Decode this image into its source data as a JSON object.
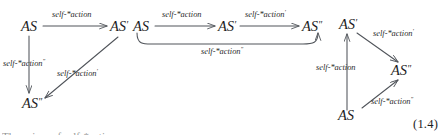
{
  "figure": {
    "equation_number": "(1.4)",
    "partial_caption_line": "The axiom of self-*action",
    "colors": {
      "arrow": "#50545a",
      "text": "#1d1d1d",
      "background": "#ffffff"
    },
    "labels": {
      "as": "AS",
      "as_prime": "AS′",
      "as_double_prime": "AS″",
      "action": "self-*action",
      "action_prime": "self-*action′",
      "action_double_prime": "self-*action″"
    },
    "diagrams": [
      {
        "id": "diagram-left",
        "nodes": [
          {
            "id": "left-as",
            "text": "AS",
            "x": 30,
            "y": 26
          },
          {
            "id": "left-as-prime",
            "text": "AS′",
            "x": 119,
            "y": 26
          },
          {
            "id": "left-as-double-prime",
            "text": "AS″",
            "x": 31,
            "y": 103
          }
        ],
        "edges": [
          {
            "id": "left-edge-top",
            "from": "AS",
            "to": "AS′",
            "label": "self-*action"
          },
          {
            "id": "left-edge-down",
            "from": "AS",
            "to": "AS″",
            "label": "self-*action″"
          },
          {
            "id": "left-edge-diagonal",
            "from": "AS′",
            "to": "AS″",
            "label": "self-*action′"
          }
        ]
      },
      {
        "id": "diagram-middle",
        "nodes": [
          {
            "id": "mid-as",
            "text": "AS",
            "x": 142,
            "y": 26
          },
          {
            "id": "mid-as-prime",
            "text": "AS′",
            "x": 227,
            "y": 26
          },
          {
            "id": "mid-as-double-prime",
            "text": "AS″",
            "x": 311,
            "y": 26
          }
        ],
        "edges": [
          {
            "id": "mid-edge-1",
            "from": "AS",
            "to": "AS′",
            "label": "self-*action"
          },
          {
            "id": "mid-edge-2",
            "from": "AS′",
            "to": "AS″",
            "label": "self-*action′"
          },
          {
            "id": "mid-edge-curve",
            "from": "AS",
            "to": "AS″",
            "label": "self-*action″"
          }
        ]
      },
      {
        "id": "diagram-right",
        "nodes": [
          {
            "id": "right-as-prime",
            "text": "AS′",
            "x": 348,
            "y": 24
          },
          {
            "id": "right-as-double-prime",
            "text": "AS″",
            "x": 400,
            "y": 70
          },
          {
            "id": "right-as",
            "text": "AS",
            "x": 347,
            "y": 115
          }
        ],
        "edges": [
          {
            "id": "right-edge-up",
            "from": "AS",
            "to": "AS′",
            "label": "self-*action"
          },
          {
            "id": "right-edge-diag-down",
            "from": "AS′",
            "to": "AS″",
            "label": "self-*action′"
          },
          {
            "id": "right-edge-diag-up",
            "from": "AS",
            "to": "AS″",
            "label": "self-*action″"
          }
        ]
      }
    ]
  }
}
